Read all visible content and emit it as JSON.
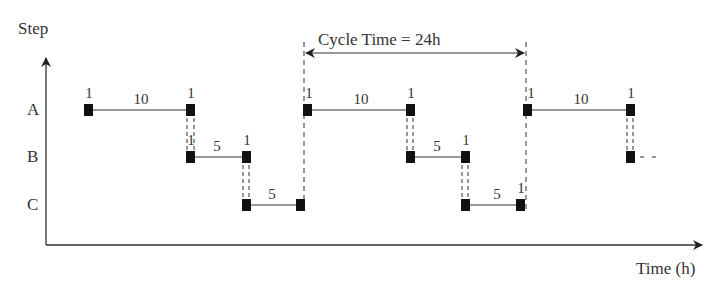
{
  "diagram": {
    "type": "cyclic schedule / gantt-style step diagram",
    "y_axis_label": "Step",
    "x_axis_label": "Time (h)",
    "rows": [
      {
        "label": "A",
        "y": 110
      },
      {
        "label": "B",
        "y": 157
      },
      {
        "label": "C",
        "y": 205
      }
    ],
    "cycle_label": "Cycle Time = 24h",
    "cycle_time_h": 24,
    "segments": [
      {
        "row": "A",
        "x1": 88,
        "x2": 190,
        "duration_label": "10",
        "start_label": "1",
        "end_label": "1"
      },
      {
        "row": "B",
        "x1": 190,
        "x2": 246,
        "duration_label": "5",
        "start_label": "1",
        "end_label": "1"
      },
      {
        "row": "C",
        "x1": 246,
        "x2": 300,
        "duration_label": "5",
        "start_label": "",
        "end_label": ""
      },
      {
        "row": "A",
        "x1": 307,
        "x2": 410,
        "duration_label": "10",
        "start_label": "1",
        "end_label": "1"
      },
      {
        "row": "B",
        "x1": 410,
        "x2": 465,
        "duration_label": "5",
        "start_label": "",
        "end_label": "1"
      },
      {
        "row": "C",
        "x1": 465,
        "x2": 520,
        "duration_label": "5",
        "start_label": "",
        "end_label": "1"
      },
      {
        "row": "A",
        "x1": 527,
        "x2": 630,
        "duration_label": "10",
        "start_label": "1",
        "end_label": "1"
      }
    ],
    "trailing": {
      "row": "B",
      "x": 630,
      "note": "continues"
    }
  }
}
